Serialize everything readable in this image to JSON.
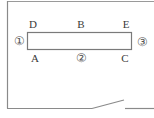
{
  "diagram": {
    "type": "floor-plan",
    "colors": {
      "line": "#8a8a8a",
      "text": "#3a3a3a",
      "background": "#ffffff"
    },
    "labels": {
      "D": "D",
      "B": "B",
      "E": "E",
      "A": "A",
      "C": "C",
      "circle1": "①",
      "circle2": "②",
      "circle3": "③"
    },
    "shapes": {
      "inner_rectangle": {
        "x": 27,
        "y": 32,
        "width": 105,
        "height": 18
      },
      "outer_wall": {
        "left": 7,
        "top": 1,
        "bottom": 108
      },
      "door": {
        "from": [
          92,
          108
        ],
        "to": [
          124,
          100
        ]
      }
    }
  }
}
